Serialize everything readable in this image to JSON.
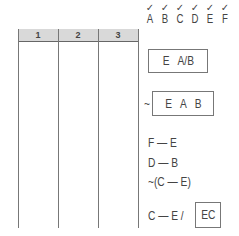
{
  "table": {
    "columns": [
      "1",
      "2",
      "3"
    ],
    "header_bg": "#d9d9d9"
  },
  "variables": {
    "checkmark": "✓",
    "letters": [
      "A",
      "B",
      "C",
      "D",
      "E",
      "F"
    ]
  },
  "rules": {
    "box1": "E   A/B",
    "box2_prefix": "~",
    "box2": "E   A   B",
    "rule_fe": "F — E",
    "rule_db": "D — B",
    "rule_not_ce": "~(C — E)",
    "rule_ce": "C — E /",
    "box_ec": "EC"
  }
}
